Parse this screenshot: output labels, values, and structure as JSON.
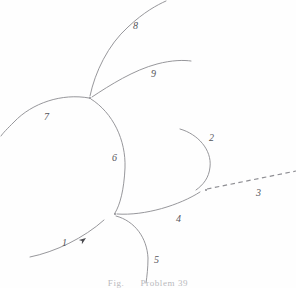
{
  "figure": {
    "width": 296,
    "height": 288,
    "background_color": "#fefefe",
    "stroke_color": "#8b8b90",
    "label_color": "#55555a",
    "caption_color": "#b9b9bd",
    "caption": {
      "prefix": "Fig.",
      "number": "",
      "title": "Problem",
      "problem_number": "39"
    },
    "labels": [
      {
        "id": "label-1",
        "text": "1",
        "x": 62,
        "y": 238
      },
      {
        "id": "label-2",
        "text": "2",
        "x": 209,
        "y": 133
      },
      {
        "id": "label-3",
        "text": "3",
        "x": 256,
        "y": 188
      },
      {
        "id": "label-4",
        "text": "4",
        "x": 176,
        "y": 214
      },
      {
        "id": "label-5",
        "text": "5",
        "x": 154,
        "y": 255
      },
      {
        "id": "label-6",
        "text": "6",
        "x": 112,
        "y": 153
      },
      {
        "id": "label-7",
        "text": "7",
        "x": 44,
        "y": 112
      },
      {
        "id": "label-8",
        "text": "8",
        "x": 133,
        "y": 21
      },
      {
        "id": "label-9",
        "text": "9",
        "x": 151,
        "y": 69
      }
    ],
    "arcs": [
      {
        "id": "arc-1",
        "label": "1",
        "style": "solid",
        "has_arrow": true,
        "d": "M 30 257 C 55 252 84 238 104 220"
      },
      {
        "id": "arc-2",
        "label": "2",
        "style": "solid",
        "has_arrow": false,
        "d": "M 180 129 C 198 134 212 150 210 167 C 209 178 203 185 196 190"
      },
      {
        "id": "arc-3",
        "label": "3",
        "style": "dashed",
        "has_arrow": false,
        "d": "M 207 189 L 296 171"
      },
      {
        "id": "arc-4",
        "label": "4",
        "style": "solid",
        "has_arrow": false,
        "d": "M 117 214 C 145 216 180 205 200 192"
      },
      {
        "id": "arc-5",
        "label": "5",
        "style": "solid",
        "has_arrow": false,
        "d": "M 116 216 C 135 221 147 238 148 258 C 148 268 147 276 146 283"
      },
      {
        "id": "arc-6",
        "label": "6",
        "style": "solid",
        "has_arrow": false,
        "d": "M 91 99 C 113 113 126 140 125 168 C 124 190 120 205 115 213"
      },
      {
        "id": "arc-7",
        "label": "7",
        "style": "solid",
        "has_arrow": false,
        "d": "M 89 98 C 62 93 32 103 14 122 C 7 129 3 133 1 136"
      },
      {
        "id": "arc-8",
        "label": "8",
        "style": "solid",
        "has_arrow": false,
        "d": "M 90 96 C 95 72 108 45 128 27 C 144 12 157 5 166 1"
      },
      {
        "id": "arc-9",
        "label": "9",
        "style": "solid",
        "has_arrow": false,
        "d": "M 92 97 C 110 85 134 70 157 64 C 172 60 184 60 191 61"
      }
    ],
    "arrow": {
      "id": "arrow-head-arc-1",
      "x": 86,
      "y": 238,
      "angle_deg": -36,
      "color": "#4a4a4e"
    },
    "vertices": [
      {
        "id": "vertex-top",
        "x": 90,
        "y": 98
      },
      {
        "id": "vertex-bottom",
        "x": 115,
        "y": 214
      },
      {
        "id": "vertex-right",
        "x": 206,
        "y": 190
      }
    ]
  }
}
